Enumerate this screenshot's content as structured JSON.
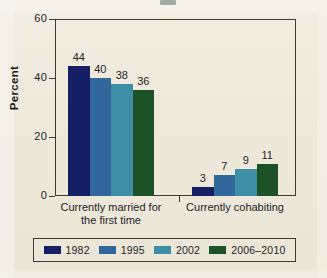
{
  "chart_data": {
    "type": "bar",
    "title": "",
    "xlabel": "",
    "ylabel": "Percent",
    "ylim": [
      0,
      60
    ],
    "yticks": [
      0,
      20,
      40,
      60
    ],
    "ytick_labels": [
      "0",
      "20",
      "40",
      "60"
    ],
    "grid": false,
    "legend_position": "bottom",
    "categories": [
      "Currently married for the first time",
      "Currently cohabiting"
    ],
    "category_lines": [
      [
        "Currently married for",
        "the first time"
      ],
      [
        "Currently cohabiting"
      ]
    ],
    "series": [
      {
        "name": "1982",
        "color": "#161f63",
        "values": [
          44,
          3
        ]
      },
      {
        "name": "1995",
        "color": "#31679b",
        "values": [
          40,
          7
        ]
      },
      {
        "name": "2002",
        "color": "#3e8fa5",
        "values": [
          38,
          9
        ]
      },
      {
        "name": "2006–2010",
        "color": "#1d5228",
        "values": [
          36,
          11
        ]
      }
    ]
  },
  "axis": {
    "y_title": "Percent"
  },
  "legend": {
    "items": [
      {
        "label": "1982",
        "color": "#161f63"
      },
      {
        "label": "1995",
        "color": "#31679b"
      },
      {
        "label": "2002",
        "color": "#3e8fa5"
      },
      {
        "label": "2006–2010",
        "color": "#1d5228"
      }
    ]
  }
}
